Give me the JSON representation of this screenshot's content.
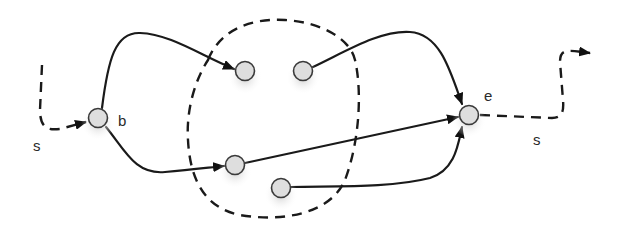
{
  "diagram": {
    "title": "",
    "labels": {
      "start_node": "b",
      "end_node": "e",
      "incoming_path": "s",
      "outgoing_path": "s"
    },
    "nodes": [
      {
        "id": "b",
        "label": "b",
        "x": 98,
        "y": 118
      },
      {
        "id": "n1",
        "label": "",
        "x": 245,
        "y": 71
      },
      {
        "id": "n2",
        "label": "",
        "x": 303,
        "y": 71
      },
      {
        "id": "n3",
        "label": "",
        "x": 235,
        "y": 165
      },
      {
        "id": "n4",
        "label": "",
        "x": 281,
        "y": 188
      },
      {
        "id": "e",
        "label": "e",
        "x": 469,
        "y": 115
      }
    ],
    "edges": [
      {
        "from": "b",
        "to": "n1",
        "style": "solid",
        "arrow": true
      },
      {
        "from": "b",
        "to": "n3",
        "style": "solid",
        "arrow": true
      },
      {
        "from": "n2",
        "to": "e",
        "style": "solid",
        "arrow": true
      },
      {
        "from": "n3",
        "to": "e",
        "style": "solid",
        "arrow": true
      },
      {
        "from": "n4",
        "to": "e",
        "style": "solid",
        "arrow": true
      },
      {
        "from": "start",
        "to": "b",
        "style": "dashed",
        "label": "s",
        "arrow": true
      },
      {
        "from": "e",
        "to": "exit",
        "style": "dashed",
        "label": "s",
        "arrow": true
      }
    ],
    "region": {
      "shape": "dashed-closed-curve",
      "contains": [
        "n1",
        "n2",
        "n3",
        "n4"
      ]
    },
    "colors": {
      "stroke": "#1a1a1a",
      "node_fill": "#dedede",
      "node_stroke": "#3a3a3a",
      "background": "#ffffff"
    }
  }
}
